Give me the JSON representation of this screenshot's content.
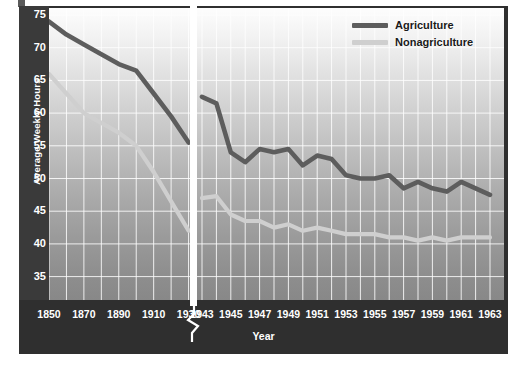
{
  "chart_data": {
    "type": "line",
    "title": "",
    "xlabel": "Year",
    "ylabel": "Average Weekly Hours",
    "ylim": [
      33,
      76
    ],
    "yticks": [
      35,
      40,
      45,
      50,
      55,
      60,
      65,
      70,
      75
    ],
    "grid": true,
    "axis_break": {
      "between": [
        1930,
        1943
      ],
      "style": "slash"
    },
    "legend_position": "top-right",
    "segments": [
      {
        "name": "historical",
        "x": [
          1850,
          1860,
          1870,
          1880,
          1890,
          1900,
          1910,
          1920,
          1930
        ],
        "xticks": [
          1850,
          1870,
          1890,
          1910,
          1930
        ],
        "series": [
          {
            "name": "Agriculture",
            "values": [
              74.0,
              72.0,
              70.5,
              69.0,
              67.5,
              66.5,
              63.0,
              59.5,
              55.5
            ]
          },
          {
            "name": "Nonagriculture",
            "values": [
              66.0,
              63.0,
              60.0,
              58.5,
              57.0,
              55.0,
              51.0,
              46.5,
              42.0
            ]
          }
        ]
      },
      {
        "name": "modern",
        "x": [
          1943,
          1944,
          1945,
          1946,
          1947,
          1948,
          1949,
          1950,
          1951,
          1952,
          1953,
          1954,
          1955,
          1956,
          1957,
          1958,
          1959,
          1960,
          1961,
          1962,
          1963
        ],
        "xticks": [
          1943,
          1945,
          1947,
          1949,
          1951,
          1953,
          1955,
          1957,
          1959,
          1961,
          1963
        ],
        "series": [
          {
            "name": "Agriculture",
            "values": [
              62.5,
              61.5,
              54.0,
              52.5,
              54.5,
              54.0,
              54.5,
              52.0,
              53.5,
              53.0,
              50.5,
              50.0,
              50.0,
              50.5,
              48.5,
              49.5,
              48.5,
              48.0,
              49.5,
              48.5,
              47.5
            ]
          },
          {
            "name": "Nonagriculture",
            "values": [
              47.0,
              47.3,
              44.5,
              43.5,
              43.5,
              42.5,
              43.0,
              42.0,
              42.5,
              42.0,
              41.5,
              41.5,
              41.5,
              41.0,
              41.0,
              40.5,
              41.0,
              40.5,
              41.0,
              41.0,
              41.0
            ]
          }
        ]
      }
    ],
    "legend": [
      {
        "label": "Agriculture",
        "color": "#5d5d5d"
      },
      {
        "label": "Nonagriculture",
        "color": "#cfcfcf"
      }
    ]
  },
  "axis": {
    "y_title": "Average Weekly Hours",
    "y_ticks": [
      "75",
      "70",
      "65",
      "60",
      "55",
      "50",
      "45",
      "40",
      "35"
    ],
    "x_title": "Year",
    "x_ticks_left": [
      "1850",
      "1870",
      "1890",
      "1910",
      "1930"
    ],
    "x_ticks_right": [
      "1943",
      "1945",
      "1947",
      "1949",
      "1951",
      "1953",
      "1955",
      "1957",
      "1959",
      "1961",
      "1963"
    ]
  },
  "legend": {
    "agriculture_label": "Agriculture",
    "nonagriculture_label": "Nonagriculture"
  },
  "colors": {
    "agriculture": "#5d5d5d",
    "nonagriculture": "#cfcfcf",
    "frame": "#2f2f2f",
    "grid": "#ffffff",
    "axis_text": "#ffffff"
  }
}
